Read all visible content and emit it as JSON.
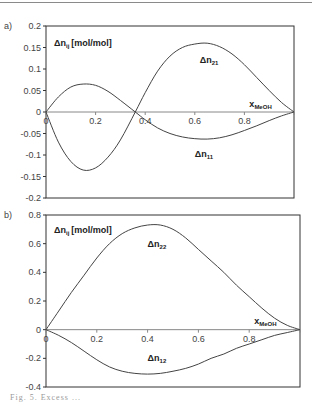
{
  "chart_data": [
    {
      "type": "line",
      "panel_label": "a)",
      "ylabel": "Δn_ij [mol/mol]",
      "ylabel_main": "Δn",
      "ylabel_sub": "ij",
      "ylabel_unit": "[mol/mol]",
      "xlabel": "x_MeOH",
      "xlabel_main": "x",
      "xlabel_sub": "MeOH",
      "ylim": [
        -0.2,
        0.2
      ],
      "xlim": [
        0,
        1
      ],
      "yticks": [
        "0.2",
        "0.15",
        "0.1",
        "0.05",
        "0",
        "-0.05",
        "-0.1",
        "-0.15",
        "-0.2"
      ],
      "xticks": [
        "0",
        "0.2",
        "0.4",
        "0.6",
        "0.8",
        "1"
      ],
      "grid": false,
      "x": [
        0,
        0.05,
        0.1,
        0.15,
        0.2,
        0.25,
        0.3,
        0.36,
        0.4,
        0.45,
        0.5,
        0.55,
        0.6,
        0.65,
        0.7,
        0.75,
        0.8,
        0.85,
        0.9,
        0.95,
        1.0
      ],
      "series": [
        {
          "name": "Δn21",
          "label_main": "Δn",
          "label_sub": "21",
          "values": [
            0,
            -0.07,
            -0.115,
            -0.135,
            -0.13,
            -0.105,
            -0.065,
            0,
            0.045,
            0.095,
            0.13,
            0.15,
            0.158,
            0.16,
            0.152,
            0.135,
            0.11,
            0.08,
            0.05,
            0.022,
            0
          ]
        },
        {
          "name": "Δn11",
          "label_main": "Δn",
          "label_sub": "11",
          "values": [
            0,
            0.035,
            0.058,
            0.065,
            0.062,
            0.048,
            0.027,
            0,
            -0.018,
            -0.037,
            -0.05,
            -0.058,
            -0.062,
            -0.063,
            -0.06,
            -0.053,
            -0.043,
            -0.032,
            -0.02,
            -0.009,
            0
          ]
        }
      ]
    },
    {
      "type": "line",
      "panel_label": "b)",
      "ylabel": "Δn_ij [mol/mol]",
      "ylabel_main": "Δn",
      "ylabel_sub": "ij",
      "ylabel_unit": "[mol/mol]",
      "xlabel": "x_MeOH",
      "xlabel_main": "x",
      "xlabel_sub": "MeOH",
      "ylim": [
        -0.4,
        0.8
      ],
      "xlim": [
        0,
        1
      ],
      "yticks": [
        "0.8",
        "0.6",
        "0.4",
        "0.2",
        "0",
        "-0.2",
        "-0.4"
      ],
      "xticks": [
        "0",
        "0.2",
        "0.4",
        "0.6",
        "0.8",
        "1"
      ],
      "grid": false,
      "x": [
        0,
        0.05,
        0.1,
        0.15,
        0.2,
        0.25,
        0.3,
        0.35,
        0.4,
        0.45,
        0.5,
        0.55,
        0.6,
        0.65,
        0.7,
        0.75,
        0.8,
        0.85,
        0.9,
        0.95,
        1.0
      ],
      "series": [
        {
          "name": "Δn22",
          "label_main": "Δn",
          "label_sub": "22",
          "values": [
            0,
            0.13,
            0.26,
            0.38,
            0.5,
            0.6,
            0.67,
            0.71,
            0.73,
            0.73,
            0.7,
            0.64,
            0.56,
            0.48,
            0.4,
            0.31,
            0.23,
            0.15,
            0.08,
            0.03,
            0
          ]
        },
        {
          "name": "Δn12",
          "label_main": "Δn",
          "label_sub": "12",
          "values": [
            0,
            -0.04,
            -0.09,
            -0.15,
            -0.21,
            -0.26,
            -0.29,
            -0.305,
            -0.31,
            -0.305,
            -0.29,
            -0.27,
            -0.24,
            -0.2,
            -0.17,
            -0.13,
            -0.1,
            -0.07,
            -0.04,
            -0.02,
            0
          ]
        }
      ]
    }
  ],
  "caption": "Fig. 5.  Excess ..."
}
